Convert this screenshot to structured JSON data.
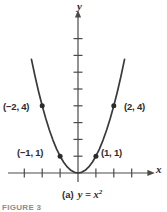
{
  "figure": {
    "caption_part": "(a)",
    "caption_equation": "y = x",
    "caption_exponent": "2",
    "figure_number": "FIGURE 3",
    "axis_x_label": "x",
    "axis_y_label": "y"
  },
  "point_labels": {
    "neg2_4": "(−2, 4)",
    "pos2_4": "(2, 4)",
    "neg1_1": "(−1, 1)",
    "pos1_1": "(1, 1)"
  },
  "colors": {
    "curve": "#3a3a3a",
    "axis": "#4a4a4a",
    "text": "#2b2b2b",
    "figure_number": "#8d8d8d",
    "background": "#ffffff"
  },
  "chart_data": {
    "type": "line",
    "function": "y = x^2",
    "xlabel": "x",
    "ylabel": "y",
    "xlim": [
      -3.6,
      4.0
    ],
    "ylim": [
      -0.6,
      8.6
    ],
    "grid": false,
    "legend": null,
    "x_ticks": [
      -3,
      -2,
      -1,
      0,
      1,
      2,
      3
    ],
    "y_ticks": [
      1,
      2,
      3,
      4,
      5,
      6,
      7,
      8
    ],
    "series": [
      {
        "name": "y = x²",
        "x": [
          -2.6,
          -2.4,
          -2.2,
          -2.0,
          -1.8,
          -1.6,
          -1.4,
          -1.2,
          -1.0,
          -0.8,
          -0.6,
          -0.4,
          -0.2,
          0.0,
          0.2,
          0.4,
          0.6,
          0.8,
          1.0,
          1.2,
          1.4,
          1.6,
          1.8,
          2.0,
          2.2,
          2.4,
          2.6
        ],
        "values": [
          6.76,
          5.76,
          4.84,
          4.0,
          3.24,
          2.56,
          1.96,
          1.44,
          1.0,
          0.64,
          0.36,
          0.16,
          0.04,
          0.0,
          0.04,
          0.16,
          0.36,
          0.64,
          1.0,
          1.44,
          1.96,
          2.56,
          3.24,
          4.0,
          4.84,
          5.76,
          6.76
        ]
      }
    ],
    "annotated_points": [
      {
        "x": -2,
        "y": 4,
        "label": "(−2, 4)"
      },
      {
        "x": 2,
        "y": 4,
        "label": "(2, 4)"
      },
      {
        "x": -1,
        "y": 1,
        "label": "(−1, 1)"
      },
      {
        "x": 1,
        "y": 1,
        "label": "(1, 1)"
      }
    ]
  }
}
